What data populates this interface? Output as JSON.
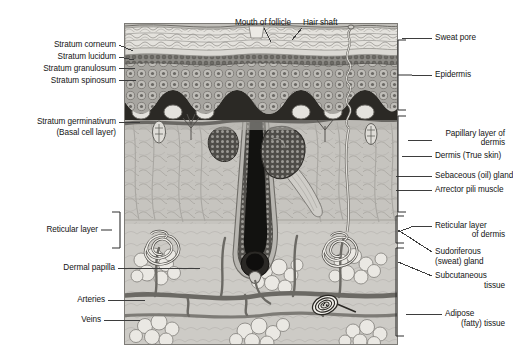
{
  "figure": {
    "type": "anatomical-diagram"
  },
  "labels": {
    "top": [
      {
        "id": "mouth-of-follicle",
        "text": "Mouth of follicle"
      },
      {
        "id": "hair-shaft",
        "text": "Hair shaft"
      }
    ],
    "left": [
      {
        "id": "stratum-corneum",
        "text": "Stratum corneum"
      },
      {
        "id": "stratum-lucidum",
        "text": "Stratum lucidum"
      },
      {
        "id": "stratum-granulosum",
        "text": "Stratum granulosum"
      },
      {
        "id": "stratum-spinosum",
        "text": "Stratum spinosum"
      },
      {
        "id": "stratum-germinativum",
        "text": "Stratum germinativum"
      },
      {
        "id": "basal-cell-layer",
        "text": "(Basal cell layer)"
      },
      {
        "id": "reticular-layer",
        "text": "Reticular layer"
      },
      {
        "id": "dermal-papilla",
        "text": "Dermal papilla"
      },
      {
        "id": "arteries",
        "text": "Arteries"
      },
      {
        "id": "veins",
        "text": "Veins"
      }
    ],
    "right": [
      {
        "id": "sweat-pore",
        "text": "Sweat pore"
      },
      {
        "id": "epidermis",
        "text": "Epidermis"
      },
      {
        "id": "papillary-layer-1",
        "text": "Papillary layer of"
      },
      {
        "id": "papillary-layer-2",
        "text": "dermis"
      },
      {
        "id": "dermis-true-skin",
        "text": "Dermis (True skin)"
      },
      {
        "id": "sebaceous-gland",
        "text": "Sebaceous (oil) gland"
      },
      {
        "id": "arrector-pili-muscle",
        "text": "Arrector pili muscle"
      },
      {
        "id": "reticular-layer-dermis-1",
        "text": "Reticular layer"
      },
      {
        "id": "reticular-layer-dermis-2",
        "text": "of dermis"
      },
      {
        "id": "sudoriferous-gland-1",
        "text": "Sudoriferous"
      },
      {
        "id": "sudoriferous-gland-2",
        "text": "(sweat) gland"
      },
      {
        "id": "subcutaneous-tissue-1",
        "text": "Subcutaneous"
      },
      {
        "id": "subcutaneous-tissue-2",
        "text": "tissue"
      },
      {
        "id": "adipose-tissue-1",
        "text": "Adipose"
      },
      {
        "id": "adipose-tissue-2",
        "text": "(fatty) tissue"
      }
    ]
  },
  "colors": {
    "ink": "#141414",
    "leader": "#3d3d3d",
    "bracket": "#2f2f2f",
    "background": "#ffffff",
    "skin_base": "#b9b7b2",
    "corneum": "#e2e0db",
    "spinosum": "#9d9b96",
    "basal": "#2a2824",
    "dermis": "#c4c2bd",
    "subcutaneous": "#cfcdc8",
    "vessel": "#6e6c67",
    "hair": "#111111",
    "fat_lobule": "#e8e6e1"
  }
}
